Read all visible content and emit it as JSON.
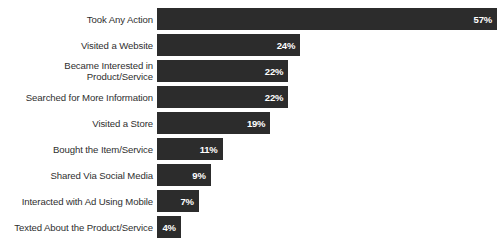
{
  "chart_data": {
    "type": "bar",
    "orientation": "horizontal",
    "title": "",
    "xlabel": "",
    "ylabel": "",
    "xlim": [
      0,
      57
    ],
    "grid": false,
    "legend": false,
    "value_suffix": "%",
    "categories": [
      "Took Any Action",
      "Visited a Website",
      "Became Interested in\nProduct/Service",
      "Searched for More Information",
      "Visited a Store",
      "Bought the Item/Service",
      "Shared Via Social Media",
      "Interacted with Ad Using Mobile",
      "Texted About the Product/Service"
    ],
    "values": [
      57,
      24,
      22,
      22,
      19,
      11,
      9,
      7,
      4
    ],
    "value_labels": [
      "57%",
      "24%",
      "22%",
      "22%",
      "19%",
      "11%",
      "9%",
      "7%",
      "4%"
    ],
    "bar_color": "#2c2c2c",
    "value_label_color": "#ffffff",
    "category_label_color": "#2f2f2f",
    "background_color": "#ffffff"
  },
  "rows": [
    {
      "label": "Took Any Action",
      "value": 57,
      "value_label": "57%"
    },
    {
      "label": "Visited a Website",
      "value": 24,
      "value_label": "24%"
    },
    {
      "label": "Became Interested in\nProduct/Service",
      "value": 22,
      "value_label": "22%"
    },
    {
      "label": "Searched for More Information",
      "value": 22,
      "value_label": "22%"
    },
    {
      "label": "Visited a Store",
      "value": 19,
      "value_label": "19%"
    },
    {
      "label": "Bought the Item/Service",
      "value": 11,
      "value_label": "11%"
    },
    {
      "label": "Shared Via Social Media",
      "value": 9,
      "value_label": "9%"
    },
    {
      "label": "Interacted with Ad Using Mobile",
      "value": 7,
      "value_label": "7%"
    },
    {
      "label": "Texted About the Product/Service",
      "value": 4,
      "value_label": "4%"
    }
  ]
}
